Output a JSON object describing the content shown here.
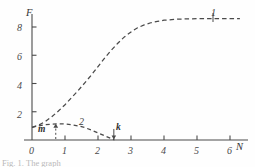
{
  "figure": {
    "background_color": "#fefefe",
    "stroke_color": "#4a4a4a",
    "caption": "Fig. 1. The graph"
  },
  "chart_data": {
    "type": "line",
    "title": "",
    "xlabel": "N",
    "ylabel": "F",
    "xlim": [
      0,
      6.6
    ],
    "ylim": [
      0,
      9.6
    ],
    "xticks": [
      "0",
      "1",
      "2",
      "3",
      "4",
      "5",
      "6"
    ],
    "xtick_values": [
      0,
      1,
      2,
      3,
      4,
      5,
      6
    ],
    "yticks": [
      "2",
      "4",
      "6",
      "8"
    ],
    "ytick_values": [
      2,
      4,
      6,
      8
    ],
    "grid": false,
    "legend_position": "inline-curve-labels",
    "linestyle": "dashed",
    "series": [
      {
        "name": "1",
        "label": "1",
        "label_x": 5.5,
        "label_y": 9.2,
        "x": [
          0.0,
          0.2,
          0.4,
          0.6,
          0.8,
          1.0,
          1.2,
          1.4,
          1.6,
          1.8,
          2.0,
          2.2,
          2.4,
          2.6,
          2.8,
          3.0,
          3.2,
          3.4,
          3.6,
          3.8,
          4.0,
          4.4,
          4.8,
          5.2,
          5.6,
          6.0,
          6.3
        ],
        "y": [
          0.9,
          1.05,
          1.3,
          1.65,
          2.05,
          2.5,
          3.0,
          3.5,
          4.05,
          4.6,
          5.2,
          5.8,
          6.35,
          6.85,
          7.3,
          7.65,
          7.95,
          8.15,
          8.3,
          8.4,
          8.48,
          8.55,
          8.58,
          8.6,
          8.6,
          8.6,
          8.6
        ]
      },
      {
        "name": "2",
        "label": "2",
        "label_x": 1.55,
        "label_y": 1.45,
        "x": [
          0.0,
          0.2,
          0.4,
          0.6,
          0.8,
          1.0,
          1.2,
          1.4,
          1.6,
          1.8,
          2.0,
          2.2,
          2.35,
          2.5
        ],
        "y": [
          0.9,
          1.0,
          1.08,
          1.13,
          1.15,
          1.13,
          1.08,
          1.0,
          0.88,
          0.7,
          0.5,
          0.3,
          0.15,
          0.0
        ]
      }
    ],
    "annotations": [
      {
        "label": "m",
        "x": 0.72,
        "y": 0.55,
        "arrow": "up",
        "marker": "dashed-vertical"
      },
      {
        "label": "k",
        "x": 2.48,
        "y": 0.62,
        "arrow": "down",
        "marker": "arrow"
      }
    ]
  }
}
